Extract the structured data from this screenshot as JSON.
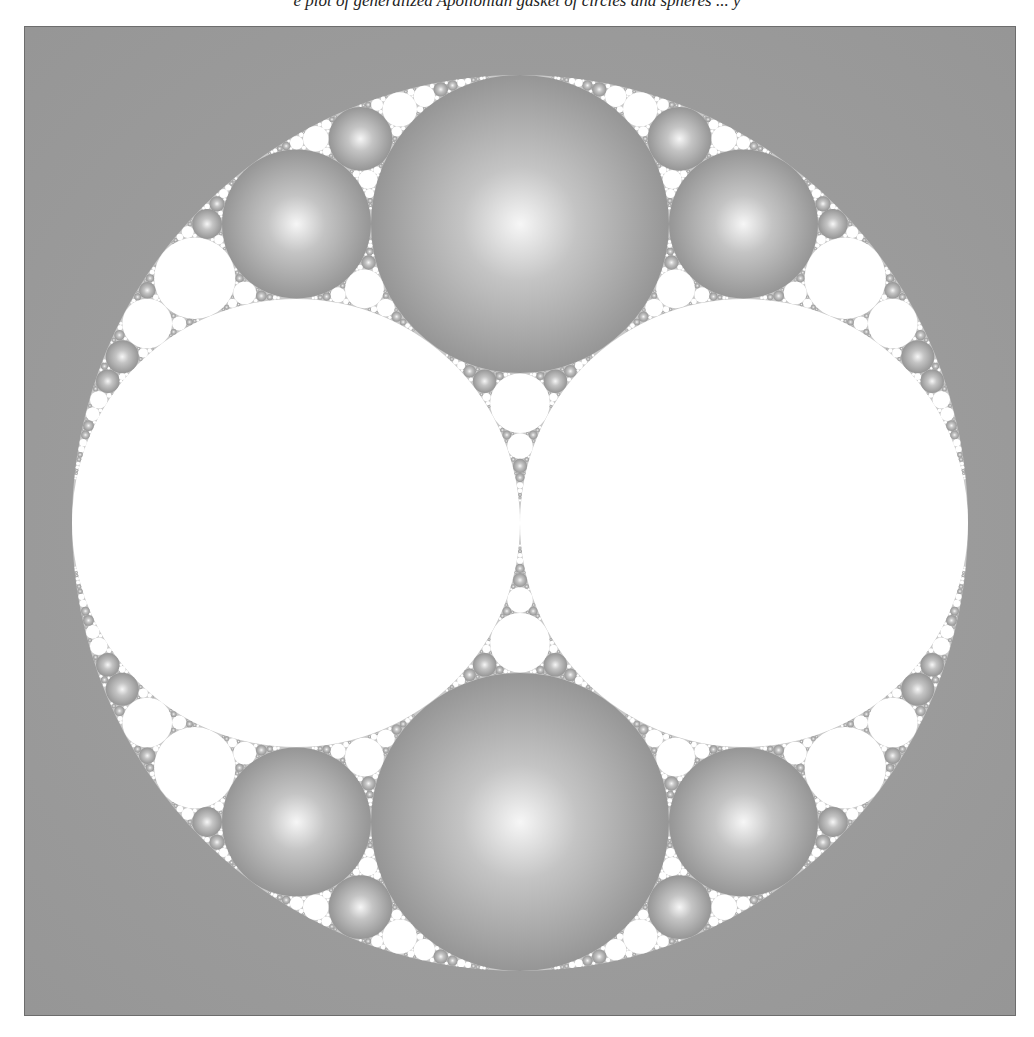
{
  "caption": "e plot of generalized Apollonian gasket of circles and spheres ... y",
  "figure": {
    "name": "Apollonian circle packing",
    "background_color": "#9a9a9a",
    "white_circle_color": "#ffffff",
    "sphere_highlight": "#f4f4f4",
    "sphere_shadow": "#8a8a8a",
    "outer_circle": {
      "cx": 519,
      "cy": 522,
      "r": 448
    },
    "seed_circles": [
      {
        "label": "left-large-white",
        "cx": 295,
        "cy": 522,
        "r": 224,
        "fill": "white"
      },
      {
        "label": "right-large-white",
        "cx": 743,
        "cy": 522,
        "r": 224,
        "fill": "white"
      },
      {
        "label": "top-sphere",
        "cx": 519,
        "cy": 223,
        "r": 149,
        "fill": "sphere"
      },
      {
        "label": "bottom-sphere",
        "cx": 519,
        "cy": 821,
        "r": 149,
        "fill": "sphere"
      }
    ],
    "min_radius_px": 1.1
  }
}
